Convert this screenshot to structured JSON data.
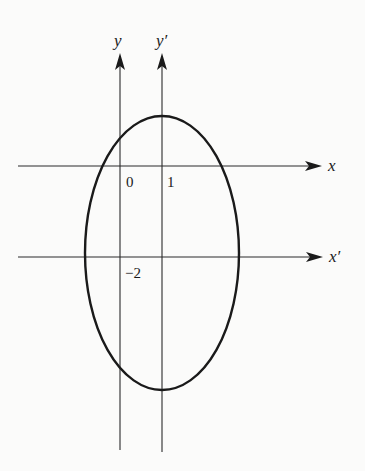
{
  "diagram": {
    "axes": {
      "x": {
        "label": "x",
        "y_px": 166
      },
      "x_prime": {
        "label": "x′",
        "y_px": 257
      },
      "y": {
        "label": "y",
        "x_px": 120
      },
      "y_prime": {
        "label": "y′",
        "x_px": 162
      }
    },
    "tick_labels": {
      "origin": "0",
      "one": "1",
      "minus_two": "−2"
    },
    "ellipse": {
      "center_original": [
        1,
        -2
      ],
      "center_px": [
        162,
        253
      ],
      "rx_px": 77,
      "ry_px": 137
    },
    "colors": {
      "ink": "#1a1a1a",
      "axis": "#2a2a2a",
      "background": "#fbfbfa"
    }
  }
}
